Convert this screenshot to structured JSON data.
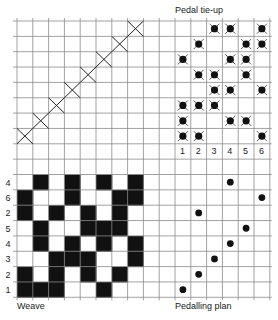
{
  "labels": {
    "tieup_title": "Pedal tie-up",
    "weave_title": "Weave",
    "pedalling_title": "Pedalling plan"
  },
  "grid": {
    "left": 17,
    "top": 21,
    "cols": 16,
    "rows": 18,
    "cell_w": 15.8,
    "cell_h": 15.35,
    "line_color": "#8a8a8a"
  },
  "threading": {
    "description": "Straight draw: X marks on diagonal",
    "marks": [
      [
        0,
        7
      ],
      [
        1,
        6
      ],
      [
        2,
        5
      ],
      [
        3,
        4
      ],
      [
        4,
        3
      ],
      [
        5,
        2
      ],
      [
        6,
        1
      ],
      [
        7,
        0
      ]
    ]
  },
  "tieup": {
    "pedal_numbers": [
      "1",
      "2",
      "3",
      "4",
      "5",
      "6"
    ],
    "rows": [
      [
        3,
        4,
        6
      ],
      [
        2,
        5,
        6
      ],
      [
        1,
        4,
        5
      ],
      [
        2,
        3,
        5
      ],
      [
        3,
        4,
        6
      ],
      [
        1,
        2,
        3
      ],
      [
        1,
        4,
        5
      ],
      [
        1,
        2,
        6
      ]
    ]
  },
  "weave": {
    "row_labels": [
      "4",
      "6",
      "2",
      "5",
      "4",
      "3",
      "2",
      "1"
    ],
    "rows": [
      [
        0,
        1,
        0,
        1,
        0,
        1,
        0,
        1
      ],
      [
        1,
        0,
        0,
        1,
        0,
        0,
        1,
        1
      ],
      [
        1,
        0,
        1,
        0,
        1,
        0,
        1,
        0
      ],
      [
        0,
        1,
        0,
        0,
        1,
        1,
        1,
        0
      ],
      [
        0,
        1,
        0,
        1,
        0,
        1,
        0,
        1
      ],
      [
        0,
        0,
        1,
        1,
        1,
        0,
        0,
        1
      ],
      [
        1,
        0,
        1,
        0,
        1,
        0,
        1,
        0
      ],
      [
        1,
        1,
        1,
        0,
        0,
        1,
        0,
        0
      ]
    ]
  },
  "pedalling": {
    "sequence_top_to_bottom": [
      4,
      6,
      2,
      5,
      4,
      3,
      2,
      1
    ]
  }
}
